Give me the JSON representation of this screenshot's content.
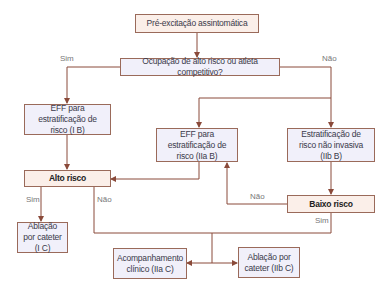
{
  "colors": {
    "line": "#8a4a3a",
    "border": "#9a6a5a",
    "pink_fill": "#fbefe9",
    "lav_fill": "#f1f0fa",
    "label": "#777777"
  },
  "nodes": {
    "start": "Pré-excitação assintomática",
    "question": "Ocupação de alto risco ou atleta competitivo?",
    "eff_ib": "EFF para estratificação de risco (I B)",
    "eff_iia": "EFF para estratificação de risco (IIa B)",
    "noninvasive": "Estratificação de risco não invasiva (IIb B)",
    "high_risk": "Alto risco",
    "low_risk": "Baixo risco",
    "ablation_ic": "Ablação por cateter (I C)",
    "followup": "Acompanhamento clínico (IIa C)",
    "ablation_iibc": "Ablação por cateter (IIb C)"
  },
  "labels": {
    "q_yes": "Sim",
    "q_no": "Não",
    "high_yes": "Sim",
    "high_no": "Não",
    "low_no": "Não",
    "low_yes": "Sim"
  }
}
